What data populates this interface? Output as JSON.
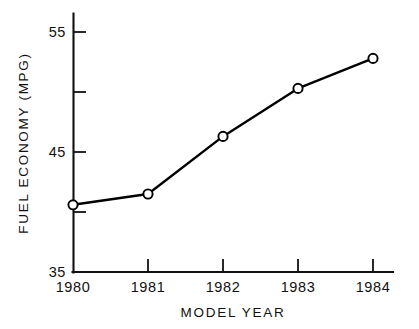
{
  "chart_data": {
    "type": "line",
    "title": "",
    "xlabel": "MODEL YEAR",
    "ylabel": "FUEL ECONOMY (MPG)",
    "categories": [
      "1980",
      "1981",
      "1982",
      "1983",
      "1984"
    ],
    "x": [
      1980,
      1981,
      1982,
      1983,
      1984
    ],
    "values": [
      40.6,
      41.5,
      46.3,
      50.3,
      52.8
    ],
    "series": [
      {
        "name": "Fuel Economy",
        "values": [
          40.6,
          41.5,
          46.3,
          50.3,
          52.8
        ]
      }
    ],
    "ylim": [
      35,
      55
    ],
    "xlim": [
      1980,
      1984
    ],
    "yticks": [
      35,
      45,
      55
    ],
    "yticks_minor": [
      40,
      50
    ],
    "ytick_labels": [
      "35",
      "45",
      "55"
    ],
    "xtick_labels": [
      "1980",
      "1981",
      "1982",
      "1983",
      "1984"
    ],
    "grid": false,
    "legend": false,
    "legend_position": "none",
    "marker": "open-circle",
    "line_color": "#000000",
    "marker_fill": "#ffffff",
    "marker_edge": "#000000",
    "background": "#ffffff",
    "axis_style": "left-and-bottom-spines-only",
    "tick_direction": "in",
    "annotations": []
  },
  "axis": {
    "y_label": "FUEL ECONOMY (MPG)",
    "x_label": "MODEL YEAR",
    "y_tick_labels": [
      "55",
      "45",
      "35"
    ],
    "x_tick_labels": [
      "1980",
      "1981",
      "1982",
      "1983",
      "1984"
    ]
  }
}
